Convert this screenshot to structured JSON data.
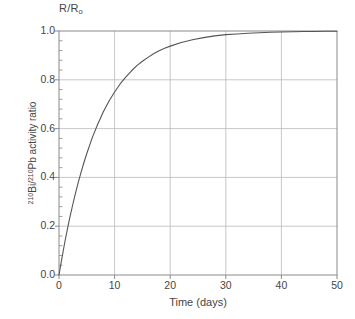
{
  "chart_data": {
    "type": "line",
    "title_main": "R/R",
    "title_sub": "o",
    "xlabel": "Time (days)",
    "ylabel": "²¹⁰Bi/²¹⁰Pb activity ratio",
    "ylabel_parts": {
      "sup1": "210",
      "text1": "Bi/",
      "sup2": "210",
      "text2": "Pb activity ratio"
    },
    "xlim": [
      0,
      50
    ],
    "ylim": [
      0.0,
      1.0
    ],
    "xticks": [
      0,
      10,
      20,
      30,
      40,
      50
    ],
    "xtick_labels": [
      "0",
      "10",
      "20",
      "30",
      "40",
      "50"
    ],
    "yticks": [
      0.0,
      0.2,
      0.4,
      0.6,
      0.8,
      1.0
    ],
    "ytick_labels": [
      "0.0",
      "0.2",
      "0.4",
      "0.6",
      "0.8",
      "1.0"
    ],
    "y_minor_tick_step": 0.04,
    "x_minor_ticks": false,
    "grid": true,
    "grid_color": "#b9b9b9",
    "line_color": "#555555",
    "axis_color": "#8a8a8a",
    "legend": "none",
    "equation": "R/Ro = 1 - exp(-ln(2)*t/5.013)",
    "half_life_days": 5.013,
    "series": [
      {
        "name": "210Bi/210Pb activity ratio",
        "x": [
          0,
          0.5,
          1,
          1.5,
          2,
          2.5,
          3,
          3.5,
          4,
          4.5,
          5,
          6,
          7,
          8,
          9,
          10,
          11,
          12,
          13,
          14,
          15,
          16,
          17,
          18,
          19,
          20,
          22,
          24,
          26,
          28,
          30,
          32,
          34,
          36,
          38,
          40,
          42,
          44,
          46,
          48,
          50
        ],
        "y": [
          0.0,
          0.066,
          0.129,
          0.187,
          0.241,
          0.291,
          0.339,
          0.383,
          0.424,
          0.462,
          0.498,
          0.564,
          0.62,
          0.67,
          0.713,
          0.75,
          0.783,
          0.811,
          0.836,
          0.858,
          0.876,
          0.892,
          0.907,
          0.919,
          0.929,
          0.938,
          0.953,
          0.964,
          0.973,
          0.98,
          0.985,
          0.988,
          0.991,
          0.993,
          0.995,
          0.996,
          0.997,
          0.998,
          0.998,
          0.999,
          0.999
        ]
      }
    ]
  }
}
